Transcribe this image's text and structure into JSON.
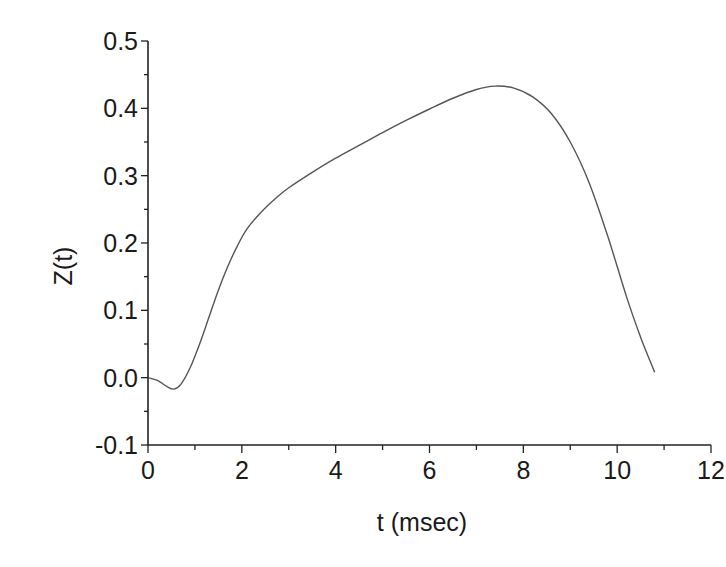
{
  "chart_data": {
    "type": "line",
    "title": "",
    "xlabel": "t (msec)",
    "ylabel": "Z(t)",
    "xlim": [
      0,
      12
    ],
    "ylim": [
      -0.1,
      0.5
    ],
    "x_ticks": [
      0,
      2,
      4,
      6,
      8,
      10,
      12
    ],
    "x_tick_labels": [
      "0",
      "2",
      "4",
      "6",
      "8",
      "10",
      "12"
    ],
    "y_ticks": [
      -0.1,
      0.0,
      0.1,
      0.2,
      0.3,
      0.4,
      0.5
    ],
    "y_tick_labels": [
      "-0.1",
      "0.0",
      "0.1",
      "0.2",
      "0.3",
      "0.4",
      "0.5"
    ],
    "x_minor_step": 1,
    "y_minor_step": 0.05,
    "grid": false,
    "legend": null,
    "series": [
      {
        "name": "Z(t)",
        "color": "#555555",
        "x": [
          0,
          0.2,
          0.4,
          0.55,
          0.7,
          0.9,
          1.1,
          1.3,
          1.5,
          1.7,
          1.9,
          2.1,
          2.4,
          2.7,
          3.0,
          3.5,
          4.0,
          4.5,
          5.0,
          5.5,
          6.0,
          6.5,
          7.0,
          7.4,
          7.8,
          8.2,
          8.6,
          9.0,
          9.4,
          9.8,
          10.2,
          10.5,
          10.7,
          10.8
        ],
        "y": [
          0.0,
          -0.004,
          -0.013,
          -0.017,
          -0.01,
          0.015,
          0.05,
          0.09,
          0.13,
          0.165,
          0.195,
          0.22,
          0.245,
          0.265,
          0.282,
          0.305,
          0.326,
          0.345,
          0.364,
          0.382,
          0.399,
          0.415,
          0.428,
          0.433,
          0.43,
          0.417,
          0.392,
          0.35,
          0.29,
          0.21,
          0.12,
          0.06,
          0.025,
          0.008
        ]
      }
    ]
  }
}
